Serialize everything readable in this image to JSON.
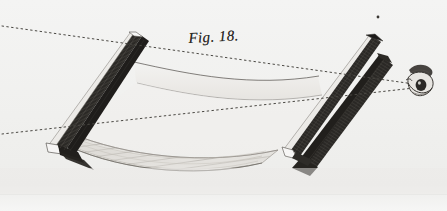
{
  "plate": {
    "caption": "Fig. 18.",
    "medium": "copperplate engraving",
    "paper_color": "#f2f2f1",
    "ink_color": "#2a2824",
    "width": 447,
    "height": 211
  },
  "figure": {
    "title": "Fig. 18.",
    "parts": [
      {
        "name": "left-bar",
        "label": "left straightedge bar",
        "tone": "dark"
      },
      {
        "name": "right-bar-upper",
        "label": "upper right straightedge bar",
        "tone": "dark"
      },
      {
        "name": "right-bar-lower",
        "label": "lower right straightedge bar",
        "tone": "dark"
      },
      {
        "name": "upper-membrane",
        "label": "curved sheet spanning between bars",
        "tone": "light"
      },
      {
        "name": "lower-band",
        "label": "sagging hatched band",
        "tone": "mid"
      },
      {
        "name": "eye",
        "label": "observer's eye",
        "tone": "dark"
      }
    ],
    "sight_lines": [
      {
        "name": "upper-sight-line",
        "from": "left margin",
        "to": "eye",
        "style": "dotted"
      },
      {
        "name": "lower-sight-line",
        "from": "left margin",
        "to": "eye",
        "style": "dotted"
      }
    ],
    "marks": [
      {
        "name": "registration-dot",
        "x": 378,
        "y": 17
      }
    ]
  },
  "colors": {
    "paper": "#f2f2f1",
    "paper_warm": "#ededeb",
    "ink_dark": "#22201d",
    "ink_mid": "#6a6762",
    "ink_light": "#b9b6b0",
    "highlight": "#fbfbfa",
    "dotted": "#4a4843"
  }
}
